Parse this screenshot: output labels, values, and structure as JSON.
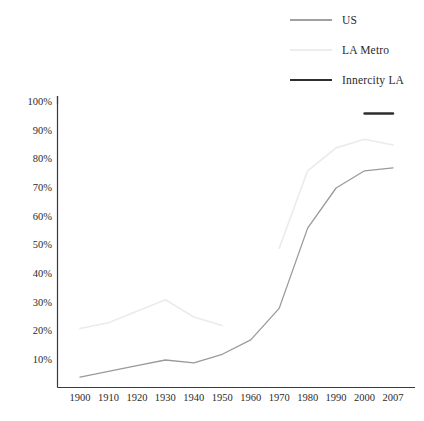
{
  "chart_data": {
    "type": "line",
    "title": "",
    "subtitle": "",
    "xlabel": "",
    "ylabel": "",
    "x": [
      "1900",
      "1910",
      "1920",
      "1930",
      "1940",
      "1950",
      "1960",
      "1970",
      "1980",
      "1990",
      "2000",
      "2007"
    ],
    "xtick_labels": [
      "1900",
      "1910",
      "1920",
      "1930",
      "1940",
      "1950",
      "1960",
      "1970",
      "1980",
      "1990",
      "2000",
      "2007"
    ],
    "ytick_labels": [
      "100%",
      "90%",
      "80%",
      "70%",
      "60%",
      "50%",
      "40%",
      "30%",
      "20%",
      "10%"
    ],
    "ytick_values": [
      100,
      90,
      80,
      70,
      60,
      50,
      40,
      30,
      20,
      10
    ],
    "ylim": [
      0,
      100
    ],
    "yunit": "%",
    "grid": false,
    "legend_position": "top-right",
    "series": [
      {
        "name": "US",
        "color": "#9a9a9a",
        "width": 1.3,
        "values": [
          4,
          6,
          8,
          10,
          9,
          12,
          17,
          28,
          56,
          70,
          76,
          77
        ]
      },
      {
        "name": "LA Metro",
        "color": "#ebebeb",
        "width": 1.6,
        "values": [
          21,
          23,
          27,
          31,
          25,
          22,
          null,
          49,
          76,
          84,
          87,
          85
        ]
      },
      {
        "name": "Innercity LA",
        "color": "#2e2e2e",
        "width": 2.4,
        "values": [
          null,
          null,
          null,
          null,
          null,
          null,
          null,
          null,
          null,
          null,
          96,
          96
        ]
      }
    ]
  },
  "legend": {
    "items": [
      {
        "label": "US",
        "swatch": "us"
      },
      {
        "label": "LA Metro",
        "swatch": "lametro"
      },
      {
        "label": "Innercity LA",
        "swatch": "inner"
      }
    ]
  },
  "axes": {
    "y_axis_name": "percent-axis",
    "x_axis_name": "year-axis"
  }
}
